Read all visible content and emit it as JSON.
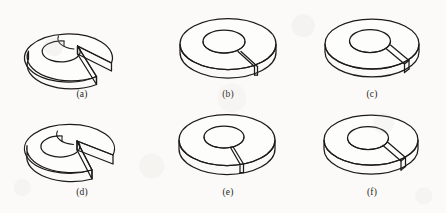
{
  "figure": {
    "kind": "engineering-isometric-line-drawing-plate",
    "background_color": "#fbfaf8",
    "ink_color": "#1d1b19",
    "columns": 3,
    "rows": 2,
    "panels": [
      {
        "id": "a",
        "label": "(a)",
        "description": "annular disc with wide pie-shaped notch cut, opening toward lower right",
        "cut_type": "wide-wedge",
        "cut_width_degrees": 60,
        "x": 8,
        "y": 6
      },
      {
        "id": "b",
        "label": "(b)",
        "description": "annular disc with narrow radial slit at lower right",
        "cut_type": "narrow-slit",
        "cut_width_degrees": 8,
        "x": 154,
        "y": 6
      },
      {
        "id": "c",
        "label": "(c)",
        "description": "annular disc with medium radial slot at lower right",
        "cut_type": "medium-slot",
        "cut_width_degrees": 20,
        "x": 298,
        "y": 6
      },
      {
        "id": "d",
        "label": "(d)",
        "description": "annular disc with wide pie-shaped notch cut, opening toward lower right",
        "cut_type": "wide-wedge",
        "cut_width_degrees": 62,
        "x": 8,
        "y": 104
      },
      {
        "id": "e",
        "label": "(e)",
        "description": "annular disc with narrow radial slit at bottom center",
        "cut_type": "narrow-slit",
        "cut_width_degrees": 7,
        "x": 154,
        "y": 104
      },
      {
        "id": "f",
        "label": "(f)",
        "description": "annular disc with medium radial slot at lower right",
        "cut_type": "medium-slot",
        "cut_width_degrees": 22,
        "x": 298,
        "y": 104
      }
    ]
  }
}
